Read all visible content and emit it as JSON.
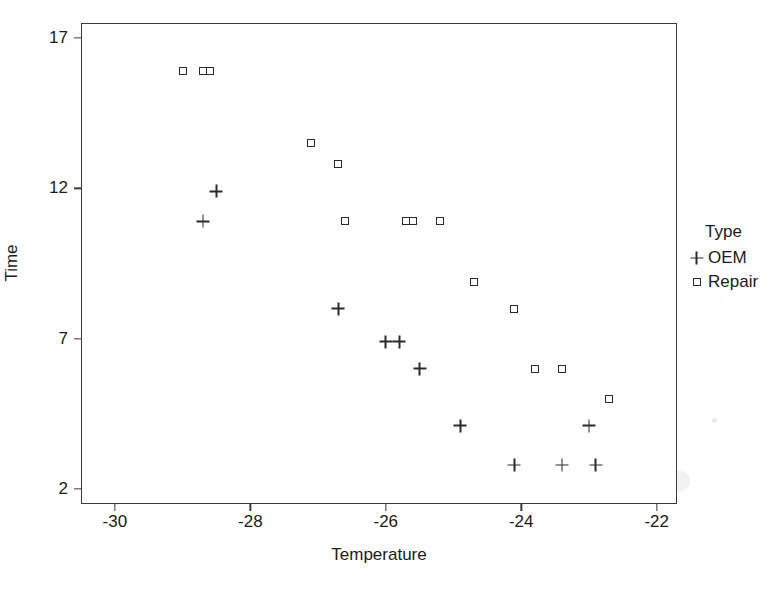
{
  "chart_data": {
    "type": "scatter",
    "title": "",
    "xlabel": "Temperature",
    "ylabel": "Time",
    "xlim": [
      -30.5,
      -21.7
    ],
    "ylim": [
      1.5,
      17.5
    ],
    "xticks": [
      -30,
      -28,
      -26,
      -24,
      -22
    ],
    "xticklabels": [
      "-30",
      "-28",
      "-26",
      "-24",
      "-22"
    ],
    "yticks": [
      2,
      7,
      12,
      17
    ],
    "yticklabels": [
      "2",
      "7",
      "12",
      "17"
    ],
    "grid": false,
    "legend": {
      "title": "Type",
      "position": "right",
      "entries": [
        {
          "name": "OEM",
          "marker": "plus"
        },
        {
          "name": "Repair",
          "marker": "square"
        }
      ]
    },
    "series": [
      {
        "name": "OEM",
        "marker": "plus",
        "color": "#2b2b2b",
        "points": [
          {
            "x": -28.7,
            "y": 10.9
          },
          {
            "x": -28.5,
            "y": 11.9
          },
          {
            "x": -26.7,
            "y": 8.0
          },
          {
            "x": -26.0,
            "y": 6.9
          },
          {
            "x": -25.8,
            "y": 6.9
          },
          {
            "x": -25.5,
            "y": 6.0
          },
          {
            "x": -24.9,
            "y": 4.1
          },
          {
            "x": -24.1,
            "y": 2.8
          },
          {
            "x": -23.4,
            "y": 2.8
          },
          {
            "x": -23.0,
            "y": 4.1
          },
          {
            "x": -22.9,
            "y": 2.8
          }
        ]
      },
      {
        "name": "Repair",
        "marker": "square",
        "color": "#2b2b2b",
        "points": [
          {
            "x": -29.0,
            "y": 15.9
          },
          {
            "x": -28.7,
            "y": 15.9
          },
          {
            "x": -28.6,
            "y": 15.9
          },
          {
            "x": -27.1,
            "y": 13.5
          },
          {
            "x": -26.7,
            "y": 12.8
          },
          {
            "x": -26.6,
            "y": 10.9
          },
          {
            "x": -25.6,
            "y": 10.9
          },
          {
            "x": -25.7,
            "y": 10.9
          },
          {
            "x": -25.2,
            "y": 10.9
          },
          {
            "x": -24.7,
            "y": 8.9
          },
          {
            "x": -24.1,
            "y": 8.0
          },
          {
            "x": -23.8,
            "y": 6.0
          },
          {
            "x": -23.4,
            "y": 6.0
          },
          {
            "x": -22.7,
            "y": 5.0
          }
        ]
      }
    ]
  }
}
